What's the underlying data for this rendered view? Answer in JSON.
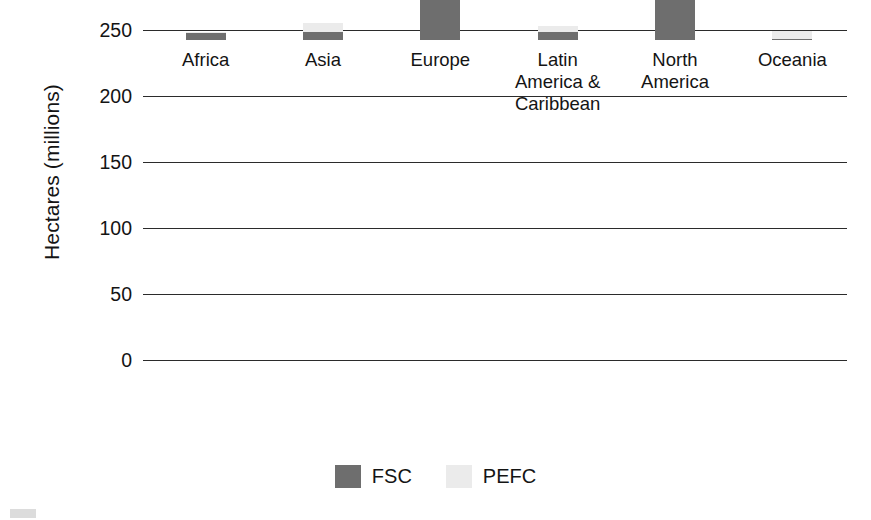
{
  "chart_data": {
    "type": "bar",
    "subtype": "stacked-bar",
    "title": "",
    "xlabel": "",
    "ylabel": "Hectares (millions)",
    "ylim": [
      0,
      250
    ],
    "ytick_labels": [
      "250",
      "200",
      "150",
      "100",
      "50",
      "0"
    ],
    "ytick_values": [
      250,
      200,
      150,
      100,
      50,
      0
    ],
    "grid": true,
    "legend_position": "bottom",
    "categories": [
      "Africa",
      "Asia",
      "Europe",
      "Latin America & Caribbean",
      "North America",
      "Oceania"
    ],
    "category_label_lines": [
      [
        "Africa"
      ],
      [
        "Asia"
      ],
      [
        "Europe"
      ],
      [
        "Latin",
        "America &",
        "Caribbean"
      ],
      [
        "North",
        "America"
      ],
      [
        "Oceania"
      ]
    ],
    "series": [
      {
        "name": "FSC",
        "color": "#6e6e6e",
        "values": [
          5,
          6,
          78,
          6,
          65,
          1
        ]
      },
      {
        "name": "PEFC",
        "color": "#ebebeb",
        "values": [
          1,
          7,
          88,
          5,
          153,
          6
        ]
      }
    ],
    "totals": [
      6,
      13,
      166,
      11,
      218,
      7
    ]
  },
  "legend": {
    "items": [
      {
        "label": "FSC",
        "swatch": "fsc"
      },
      {
        "label": "PEFC",
        "swatch": "pefc"
      }
    ]
  },
  "colors": {
    "fsc": "#6e6e6e",
    "pefc": "#ebebeb",
    "axis": "#2b2b2b",
    "text": "#141414",
    "background": "#ffffff"
  }
}
